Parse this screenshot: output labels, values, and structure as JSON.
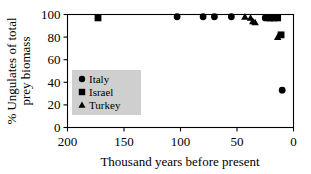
{
  "chart_data": {
    "type": "scatter",
    "title": "",
    "xlabel": "Thousand years before present",
    "ylabel_line1": "% Ungulates of total",
    "ylabel_line2": "prey biomass",
    "xlim": [
      200,
      0
    ],
    "ylim": [
      0,
      100
    ],
    "x_reversed": true,
    "grid": false,
    "xticks": [
      200,
      150,
      100,
      50,
      0
    ],
    "xticklabels": [
      "200",
      "150",
      "100",
      "50",
      "0"
    ],
    "yticks": [
      0,
      20,
      40,
      60,
      80,
      100
    ],
    "yticklabels": [
      "0",
      "20",
      "40",
      "60",
      "80",
      "100"
    ],
    "legend_position": "center-left-inside",
    "marker_color": "#000000",
    "legend_bg_color": "#cfcfcf",
    "series": [
      {
        "name": "Italy",
        "marker": "circle",
        "points": [
          {
            "x": 103,
            "y": 98
          },
          {
            "x": 80,
            "y": 98
          },
          {
            "x": 70,
            "y": 98
          },
          {
            "x": 55,
            "y": 98
          },
          {
            "x": 25,
            "y": 97
          },
          {
            "x": 22,
            "y": 97
          },
          {
            "x": 19,
            "y": 97
          },
          {
            "x": 10,
            "y": 33
          }
        ]
      },
      {
        "name": "Israel",
        "marker": "square",
        "points": [
          {
            "x": 173,
            "y": 97
          },
          {
            "x": 21,
            "y": 97
          },
          {
            "x": 17,
            "y": 97
          },
          {
            "x": 14,
            "y": 97
          },
          {
            "x": 11,
            "y": 82
          }
        ]
      },
      {
        "name": "Turkey",
        "marker": "triangle",
        "points": [
          {
            "x": 43,
            "y": 98
          },
          {
            "x": 38,
            "y": 97
          },
          {
            "x": 36,
            "y": 94
          },
          {
            "x": 34,
            "y": 93
          },
          {
            "x": 14,
            "y": 80
          }
        ]
      }
    ]
  },
  "legend": {
    "entries": [
      {
        "label": "Italy",
        "marker": "circle"
      },
      {
        "label": "Israel",
        "marker": "square"
      },
      {
        "label": "Turkey",
        "marker": "triangle"
      }
    ]
  }
}
